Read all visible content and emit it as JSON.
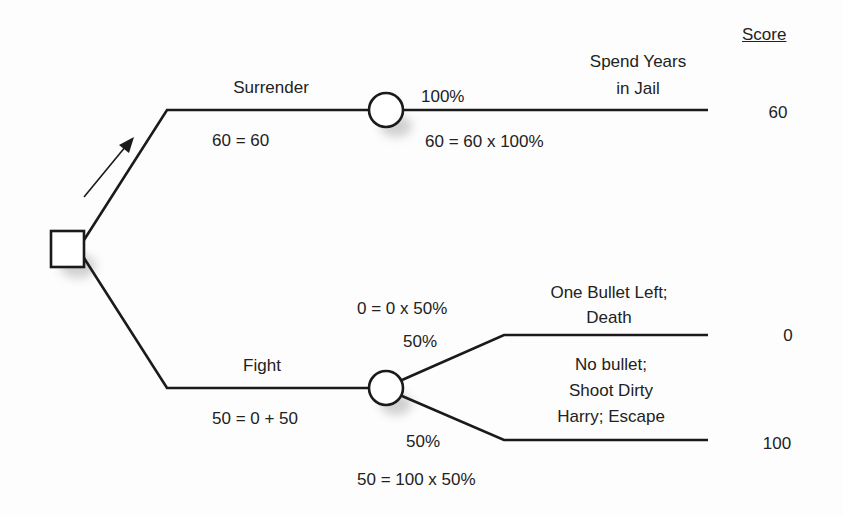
{
  "header": {
    "score_label": "Score"
  },
  "decision_node": {
    "type": "square",
    "arrow_direction": "toward Surrender"
  },
  "branches": [
    {
      "label": "Surrender",
      "value_formula": "60 = 60",
      "chance_node": {
        "outcomes": [
          {
            "probability": "100%",
            "formula": "60 = 60 x 100%",
            "label_lines": [
              "Spend Years",
              "in Jail"
            ],
            "score": "60"
          }
        ]
      }
    },
    {
      "label": "Fight",
      "value_formula": "50 = 0 + 50",
      "chance_node": {
        "outcomes": [
          {
            "probability": "50%",
            "formula": "0 = 0 x 50%",
            "label_lines": [
              "One Bullet Left;",
              "Death"
            ],
            "score": "0"
          },
          {
            "probability": "50%",
            "formula": "50 = 100 x 50%",
            "label_lines": [
              "No bullet;",
              "Shoot Dirty",
              "Harry; Escape"
            ],
            "score": "100"
          }
        ]
      }
    }
  ],
  "colors": {
    "line": "#1a1a1a",
    "background": "#fdfdfd",
    "shadow": "#9a9a9a"
  }
}
